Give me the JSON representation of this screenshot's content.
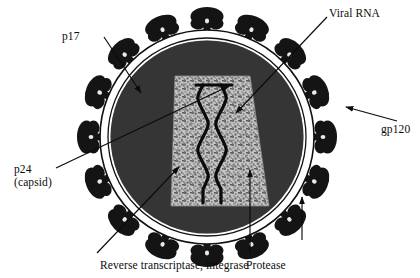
{
  "figure": {
    "type": "labeled-biological-diagram",
    "background_color": "#ffffff"
  },
  "labels": {
    "p17": "p17",
    "viral_rna": "Viral RNA",
    "gp120": "gp120",
    "p24_line1": "p24",
    "p24_line2": "(capsid)",
    "reverse_transcriptase_integrase": "Reverse transcriptase, integrase",
    "protease": "Protease"
  },
  "structures": {
    "envelope": {
      "name": "lipid-envelope",
      "fill": "#ffffff",
      "stroke": "#111111",
      "cx": 207,
      "cy": 137,
      "rx": 107,
      "ry": 107
    },
    "matrix": {
      "name": "matrix-p17-layer",
      "fill": "#3a3a3a",
      "cx": 207,
      "cy": 137,
      "rx": 96,
      "ry": 96
    },
    "capsid": {
      "name": "capsid-p24-cone",
      "fill": "#b9b9b9",
      "speckled": true,
      "shape": "trapezoid-cone"
    },
    "rna": {
      "name": "viral-rna-double-helix",
      "stroke": "#0b0b0b",
      "turns": 4
    },
    "spikes": {
      "name": "gp120-gp41-spikes",
      "fill": "#141414",
      "count": 16,
      "shape": "mushroom-knob"
    }
  },
  "leader_lines": [
    {
      "name": "p17-leader",
      "label": "p17",
      "from": [
        103,
        37
      ],
      "to": [
        141,
        94
      ],
      "arrow": true
    },
    {
      "name": "viral-rna-leader",
      "label": "Viral RNA",
      "from": [
        327,
        16
      ],
      "to": [
        234,
        114
      ],
      "arrow": true
    },
    {
      "name": "gp120-leader",
      "label": "gp120",
      "from": [
        396,
        121
      ],
      "to": [
        345,
        108
      ],
      "arrow": true
    },
    {
      "name": "p24-leader",
      "label": "p24",
      "from": [
        57,
        168
      ],
      "to": [
        230,
        86
      ],
      "arrow": true
    },
    {
      "name": "rti-leader",
      "label": "Reverse transcriptase, integrase",
      "from": [
        98,
        252
      ],
      "to": [
        178,
        166
      ],
      "arrow": true
    },
    {
      "name": "protease-leader",
      "label": "Protease",
      "from": [
        250,
        252
      ],
      "to": [
        250,
        169
      ],
      "arrow": true
    },
    {
      "name": "envelope-leader",
      "label": "",
      "from": [
        302,
        238
      ],
      "to": [
        302,
        198
      ],
      "arrow": true
    }
  ],
  "colors": {
    "matrix": "#3a3a3a",
    "capsid": "#b9b9b9",
    "spike": "#141414",
    "outline": "#111111",
    "text": "#0b0b0b",
    "background": "#ffffff"
  }
}
